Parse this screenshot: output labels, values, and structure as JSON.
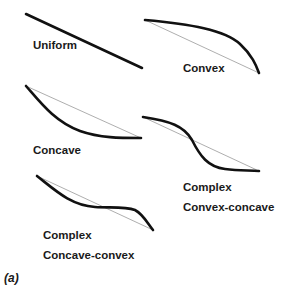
{
  "figure": {
    "panel_label": "(a)",
    "shapes": [
      {
        "id": "uniform",
        "lines": [
          "Uniform"
        ]
      },
      {
        "id": "convex",
        "lines": [
          "Convex"
        ]
      },
      {
        "id": "concave",
        "lines": [
          "Concave"
        ]
      },
      {
        "id": "convex-concave",
        "lines": [
          "Complex",
          "Convex-concave"
        ]
      },
      {
        "id": "concave-convex",
        "lines": [
          "Complex",
          "Concave-convex"
        ]
      }
    ],
    "colors": {
      "curve": "#111111",
      "reference_line": "#999999",
      "text": "#1a1a1a"
    }
  }
}
